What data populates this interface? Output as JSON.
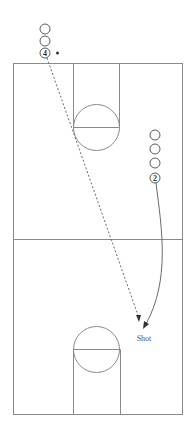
{
  "diagram": {
    "colors": {
      "court_lines": "#8a8a8a",
      "player_outline": "#5a5a5a",
      "paths": "#6a6a6a",
      "arrow": "#333333",
      "background": "#ffffff"
    },
    "court": {
      "outline": {
        "x": 13,
        "y": 63,
        "width": 169,
        "height": 351
      },
      "midcourt_line_y": 239,
      "top_key": {
        "x": 73,
        "y": 63,
        "width": 46,
        "height": 64
      },
      "top_circle": {
        "cx": 96,
        "cy": 127,
        "r": 23
      },
      "bottom_key": {
        "x": 73,
        "y": 349,
        "width": 47,
        "height": 65
      },
      "bottom_circle": {
        "cx": 96,
        "cy": 349,
        "r": 23
      }
    },
    "players": {
      "line_a": {
        "label": "4",
        "circles": [
          {
            "cx": 45,
            "cy": 29,
            "r": 5
          },
          {
            "cx": 45,
            "cy": 41,
            "r": 5
          },
          {
            "cx": 45,
            "cy": 53,
            "r": 5,
            "labeled": true
          }
        ],
        "ball_marker": {
          "cx": 57,
          "cy": 53,
          "r": 1.5
        }
      },
      "line_b": {
        "label": "2",
        "circles": [
          {
            "cx": 155,
            "cy": 135,
            "r": 5
          },
          {
            "cx": 155,
            "cy": 149,
            "r": 5
          },
          {
            "cx": 155,
            "cy": 163,
            "r": 5
          },
          {
            "cx": 155,
            "cy": 178,
            "r": 5,
            "labeled": true
          }
        ]
      }
    },
    "paths": {
      "pass": {
        "type": "dashed",
        "from": "player 4",
        "to": "shot spot"
      },
      "cut": {
        "type": "solid-curve",
        "from": "player 2",
        "to": "shot spot"
      }
    },
    "annotations": {
      "shot_label": "Shot"
    }
  }
}
